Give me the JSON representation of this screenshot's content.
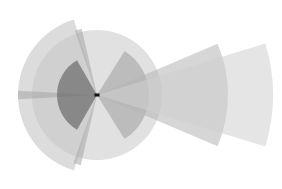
{
  "diagram": {
    "type": "radial-wedge-overlay",
    "center": {
      "x": 97,
      "y": 95
    },
    "wedges": [
      {
        "name": "base-circle",
        "radius": 65,
        "start_deg": 0,
        "end_deg": 359.9,
        "color": "#c8c8c8",
        "opacity": 0.55
      },
      {
        "name": "large-left-wedge",
        "radius": 79,
        "start_deg": 107,
        "end_deg": 253,
        "color": "#c4c4c4",
        "opacity": 0.6
      },
      {
        "name": "top-spoke",
        "radius": 68,
        "start_deg": 103,
        "end_deg": 109,
        "color": "#a8a8a8",
        "opacity": 0.55
      },
      {
        "name": "bottom-spoke",
        "radius": 72,
        "start_deg": 251,
        "end_deg": 257,
        "color": "#a8a8a8",
        "opacity": 0.55
      },
      {
        "name": "left-horizontal-spoke",
        "radius": 79,
        "start_deg": 177,
        "end_deg": 183,
        "color": "#a0a0a0",
        "opacity": 0.5
      },
      {
        "name": "dark-left-wedge",
        "radius": 40,
        "start_deg": 120,
        "end_deg": 240,
        "color": "#707070",
        "opacity": 0.75
      },
      {
        "name": "mid-right-wedge",
        "radius": 52,
        "start_deg": -58,
        "end_deg": 58,
        "color": "#a4a4a4",
        "opacity": 0.6
      },
      {
        "name": "long-right-wedge",
        "radius": 131,
        "start_deg": -23,
        "end_deg": 23,
        "color": "#b4b4b4",
        "opacity": 0.55
      },
      {
        "name": "longest-right-wedge",
        "radius": 176,
        "start_deg": -17,
        "end_deg": 17,
        "color": "#d0d0d0",
        "opacity": 0.55
      }
    ],
    "center_marker": {
      "color": "#111111",
      "width": 5,
      "height": 3
    }
  }
}
